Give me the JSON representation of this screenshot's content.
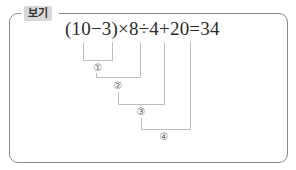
{
  "example_box": {
    "label": "보기",
    "expression": "(10−3)×8÷4+20=34",
    "steps": [
      {
        "marker": "①",
        "covers": "10−3"
      },
      {
        "marker": "②",
        "covers": "(10−3)×8"
      },
      {
        "marker": "③",
        "covers": "(10−3)×8÷4"
      },
      {
        "marker": "④",
        "covers": "(10−3)×8÷4+20"
      }
    ]
  },
  "colors": {
    "border": "#8a8a8a",
    "tag_background": "#d9d9d9",
    "bracket_line": "#bdbdbd",
    "text": "#2b2b2b"
  }
}
